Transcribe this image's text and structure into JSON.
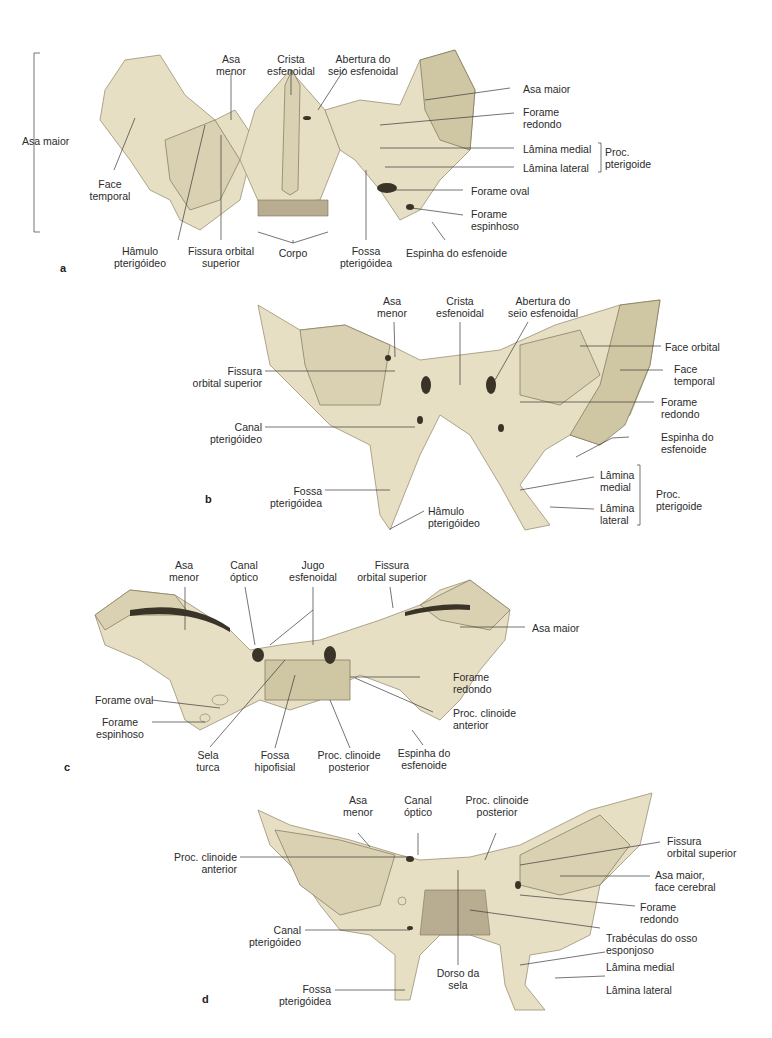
{
  "figure": {
    "colors": {
      "bone_light": "#e6dfc4",
      "bone_mid": "#d9d1b2",
      "bone_shadow": "#cfc7a4",
      "leader_line": "#3a3a3a",
      "text": "#2b2b2b"
    },
    "panels": [
      {
        "letter": "a",
        "labels": {
          "asa_maior_bracket": "Asa maior",
          "face_temporal": "Face\ntemporal",
          "asa_menor": "Asa\nmenor",
          "crista_esfenoidal": "Crista\nesfenoidal",
          "abertura_seio": "Abertura do\nseio esfenoidal",
          "asa_maior_right": "Asa maior",
          "forame_redondo": "Forame\nredondo",
          "lamina_medial": "Lâmina medial",
          "lamina_lateral": "Lâmina lateral",
          "proc_pterigoide": "Proc.\npterigoide",
          "forame_oval": "Forame oval",
          "forame_espinhoso": "Forame\nespinhoso",
          "espinha_esfenoide": "Espinha do esfenoide",
          "hamulo": "Hâmulo\npterigóideo",
          "fissura_orbital": "Fissura orbital\nsuperior",
          "corpo": "Corpo",
          "fossa_pterigoidea": "Fossa\npterigóidea"
        }
      },
      {
        "letter": "b",
        "labels": {
          "asa_menor": "Asa\nmenor",
          "crista_esfenoidal": "Crista\nesfenoidal",
          "abertura_seio": "Abertura do\nseio esfenoidal",
          "face_orbital": "Face orbital",
          "face_temporal": "Face\ntemporal",
          "forame_redondo": "Forame\nredondo",
          "espinha_esfenoide": "Espinha do\nesfenoide",
          "lamina_medial": "Lâmina\nmedial",
          "lamina_lateral": "Lâmina\nlateral",
          "proc_pterigoide": "Proc.\npterigoide",
          "fissura_orbital": "Fissura\norbital superior",
          "canal_pterigoideo": "Canal\npterigóideo",
          "fossa_pterigoidea": "Fossa\npterigóidea",
          "hamulo": "Hâmulo\npterigóideo"
        }
      },
      {
        "letter": "c",
        "labels": {
          "asa_menor": "Asa\nmenor",
          "canal_optico": "Canal\nóptico",
          "jugo_esfenoidal": "Jugo\nesfenoidal",
          "fissura_orbital": "Fissura\norbital superior",
          "asa_maior": "Asa maior",
          "forame_redondo": "Forame\nredondo",
          "proc_clinoide_anterior": "Proc. clinoide\nanterior",
          "espinha_esfenoide": "Espinha do\nesfenoide",
          "forame_oval": "Forame oval",
          "forame_espinhoso": "Forame\nespinhoso",
          "sela_turca": "Sela\nturca",
          "fossa_hipofisial": "Fossa\nhipofisial",
          "proc_clinoide_posterior": "Proc. clinoide\nposterior"
        }
      },
      {
        "letter": "d",
        "labels": {
          "asa_menor": "Asa\nmenor",
          "canal_optico": "Canal\nóptico",
          "proc_clinoide_posterior": "Proc. clinoide\nposterior",
          "fissura_orbital": "Fissura\norbital superior",
          "asa_maior_face_cerebral": "Asa maior,\nface cerebral",
          "forame_redondo": "Forame\nredondo",
          "trabeculas": "Trabéculas do osso\nesponjoso",
          "lamina_medial": "Lâmina medial",
          "lamina_lateral": "Lâmina lateral",
          "proc_clinoide_anterior": "Proc. clinoide\nanterior",
          "canal_pterigoideo": "Canal\npterigóideo",
          "fossa_pterigoidea": "Fossa\npterigóidea",
          "dorso_sela": "Dorso da\nsela"
        }
      }
    ]
  }
}
